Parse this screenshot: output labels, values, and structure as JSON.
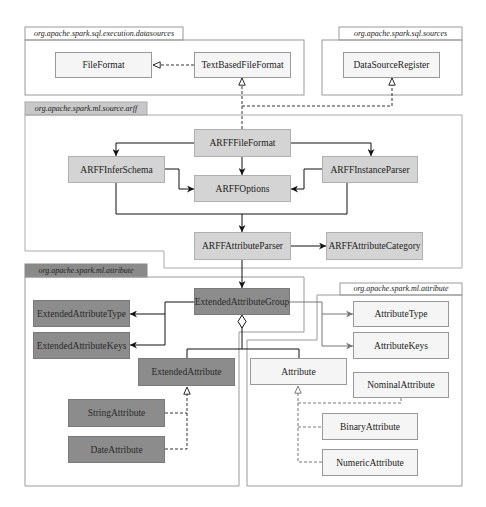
{
  "packages": {
    "sql_execution_datasources": "org.apache.spark.sql.execution.datasources",
    "sql_sources": "org.apache.spark.sql.sources",
    "ml_source_arff": "org.apache.spark.ml.source.arff",
    "ml_attribute_extended": "org.apache.spark.ml.attribute",
    "ml_attribute": "org.apache.spark.ml.attribute"
  },
  "classes": {
    "file_format": "FileFormat",
    "text_based_file_format": "TextBasedFileFormat",
    "data_source_register": "DataSourceRegister",
    "arff_file_format": "ARFFFileFormat",
    "arff_infer_schema": "ARFFInferSchema",
    "arff_options": "ARFFOptions",
    "arff_instance_parser": "ARFFInstanceParser",
    "arff_attribute_parser": "ARFFAttributeParser",
    "arff_attribute_category": "ARFFAttributeCategory",
    "extended_attribute_group": "ExtendedAttributeGroup",
    "extended_attribute_type": "ExtendedAttributeType",
    "extended_attribute_keys": "ExtendedAttributeKeys",
    "extended_attribute": "ExtendedAttribute",
    "string_attribute": "StringAttribute",
    "date_attribute": "DateAttribute",
    "attribute_type": "AttributeType",
    "attribute_keys": "AttributeKeys",
    "attribute": "Attribute",
    "nominal_attribute": "NominalAttribute",
    "binary_attribute": "BinaryAttribute",
    "numeric_attribute": "NumericAttribute"
  },
  "relationships": [
    {
      "from": "TextBasedFileFormat",
      "to": "FileFormat",
      "type": "realization"
    },
    {
      "from": "ARFFFileFormat",
      "to": "TextBasedFileFormat",
      "type": "realization"
    },
    {
      "from": "ARFFFileFormat",
      "to": "DataSourceRegister",
      "type": "realization"
    },
    {
      "from": "ARFFFileFormat",
      "to": "ARFFInferSchema",
      "type": "association"
    },
    {
      "from": "ARFFFileFormat",
      "to": "ARFFInstanceParser",
      "type": "association"
    },
    {
      "from": "ARFFFileFormat",
      "to": "ARFFOptions",
      "type": "association"
    },
    {
      "from": "ARFFInferSchema",
      "to": "ARFFOptions",
      "type": "association"
    },
    {
      "from": "ARFFInstanceParser",
      "to": "ARFFOptions",
      "type": "association"
    },
    {
      "from": "ARFFInferSchema",
      "to": "ARFFAttributeParser",
      "type": "association"
    },
    {
      "from": "ARFFInstanceParser",
      "to": "ARFFAttributeParser",
      "type": "association"
    },
    {
      "from": "ARFFAttributeParser",
      "to": "ARFFAttributeCategory",
      "type": "association"
    },
    {
      "from": "ARFFAttributeParser",
      "to": "ExtendedAttributeGroup",
      "type": "association"
    },
    {
      "from": "ExtendedAttributeGroup",
      "to": "ExtendedAttributeType",
      "type": "association"
    },
    {
      "from": "ExtendedAttributeGroup",
      "to": "ExtendedAttributeKeys",
      "type": "association"
    },
    {
      "from": "ExtendedAttributeGroup",
      "to": "AttributeType",
      "type": "association"
    },
    {
      "from": "ExtendedAttributeGroup",
      "to": "AttributeKeys",
      "type": "association"
    },
    {
      "from": "ExtendedAttributeGroup",
      "to": "ExtendedAttribute",
      "type": "aggregation"
    },
    {
      "from": "ExtendedAttributeGroup",
      "to": "Attribute",
      "type": "aggregation"
    },
    {
      "from": "StringAttribute",
      "to": "ExtendedAttribute",
      "type": "realization"
    },
    {
      "from": "DateAttribute",
      "to": "ExtendedAttribute",
      "type": "realization"
    },
    {
      "from": "NominalAttribute",
      "to": "Attribute",
      "type": "realization"
    },
    {
      "from": "BinaryAttribute",
      "to": "Attribute",
      "type": "realization"
    },
    {
      "from": "NumericAttribute",
      "to": "Attribute",
      "type": "realization"
    }
  ],
  "colors": {
    "light_class": "#f5f5f5",
    "arff_class": "#d4d4d4",
    "extended_class": "#8c8c8c",
    "outline": "#999999"
  }
}
